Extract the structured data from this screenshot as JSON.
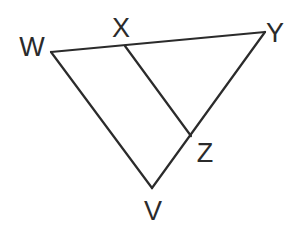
{
  "diagram": {
    "type": "geometry-triangle",
    "stroke_color": "#2b2b2b",
    "background": "#ffffff",
    "points": {
      "W": {
        "label": "W",
        "x": 51,
        "y": 52,
        "label_x": 32,
        "label_y": 49
      },
      "X": {
        "label": "X",
        "x": 125,
        "y": 46,
        "label_x": 121,
        "label_y": 30
      },
      "Y": {
        "label": "Y",
        "x": 265,
        "y": 32,
        "label_x": 275,
        "label_y": 35
      },
      "Z": {
        "label": "Z",
        "x": 191,
        "y": 136,
        "label_x": 205,
        "label_y": 155
      },
      "V": {
        "label": "V",
        "x": 152,
        "y": 188,
        "label_x": 153,
        "label_y": 213
      }
    },
    "segments": [
      {
        "name": "WY",
        "from": "W",
        "to": "Y"
      },
      {
        "name": "YV",
        "from": "Y",
        "to": "V"
      },
      {
        "name": "VW",
        "from": "V",
        "to": "W"
      },
      {
        "name": "XZ",
        "from": "X",
        "to": "Z"
      }
    ]
  }
}
